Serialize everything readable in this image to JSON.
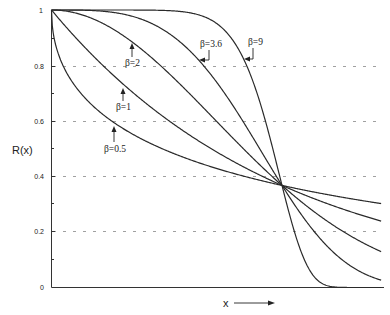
{
  "chart_data": {
    "type": "line",
    "title": "",
    "function": "R(x) = exp(-(x/eta)^beta)  (Weibull reliability)",
    "xlabel": "x",
    "ylabel": "R(x)",
    "xlim": [
      0,
      1.43
    ],
    "ylim": [
      0,
      1
    ],
    "yticks": [
      0,
      0.2,
      0.4,
      0.6,
      0.8,
      1
    ],
    "ytick_labels": [
      "0",
      "0.2",
      "0.4",
      "0.6",
      "0.8",
      "1"
    ],
    "yminor_ticks": [
      0.1,
      0.3,
      0.5,
      0.7,
      0.9
    ],
    "grid": {
      "horizontal_dashed_at": [
        0.2,
        0.4,
        0.6,
        0.8
      ]
    },
    "crossing_point": {
      "x": 1.0,
      "y": 0.368
    },
    "series": [
      {
        "name": "β=0.5",
        "beta": 0.5,
        "x": [
          0,
          0.05,
          0.1,
          0.25,
          0.5,
          0.75,
          1.0,
          1.25,
          1.43
        ],
        "values": [
          1,
          0.8,
          0.73,
          0.61,
          0.49,
          0.42,
          0.37,
          0.33,
          0.3
        ]
      },
      {
        "name": "β=1",
        "beta": 1,
        "x": [
          0,
          0.25,
          0.5,
          0.75,
          1.0,
          1.25,
          1.43
        ],
        "values": [
          1,
          0.78,
          0.61,
          0.47,
          0.37,
          0.29,
          0.24
        ]
      },
      {
        "name": "β=2",
        "beta": 2,
        "x": [
          0,
          0.25,
          0.5,
          0.75,
          1.0,
          1.25,
          1.43
        ],
        "values": [
          1,
          0.94,
          0.78,
          0.57,
          0.37,
          0.21,
          0.13
        ]
      },
      {
        "name": "β=3.6",
        "beta": 3.6,
        "x": [
          0,
          0.25,
          0.5,
          0.75,
          1.0,
          1.25,
          1.43
        ],
        "values": [
          1,
          0.99,
          0.92,
          0.7,
          0.37,
          0.09,
          0.03
        ]
      },
      {
        "name": "β=9",
        "beta": 9,
        "x": [
          0,
          0.5,
          0.75,
          0.9,
          1.0,
          1.1,
          1.25,
          1.43
        ],
        "values": [
          1,
          1.0,
          0.93,
          0.68,
          0.37,
          0.1,
          0.0,
          0.0
        ]
      }
    ],
    "annotations": [
      {
        "text": "β=0.5",
        "arrow": "up"
      },
      {
        "text": "β=1",
        "arrow": "up"
      },
      {
        "text": "β=2",
        "arrow": "up"
      },
      {
        "text": "β=3.6",
        "arrow": "left"
      },
      {
        "text": "β=9",
        "arrow": "left"
      }
    ]
  },
  "labels": {
    "ylabel": "R(x)",
    "xlabel": "x",
    "y0": "0",
    "y02": "0.2",
    "y04": "0.4",
    "y06": "0.6",
    "y08": "0.8",
    "y1": "1",
    "beta05": "β=0.5",
    "beta1": "β=1",
    "beta2": "β=2",
    "beta36": "β=3.6",
    "beta9": "β=9"
  },
  "colors": {
    "line": "#2a2a2a",
    "grid": "#777777",
    "axis": "#333333"
  }
}
